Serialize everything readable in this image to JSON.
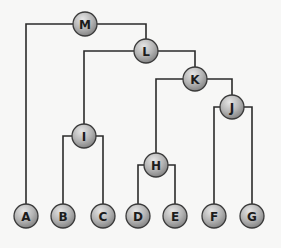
{
  "diagram": {
    "type": "binary-tree",
    "colors": {
      "edge": "#2b2b2b",
      "node_fill_light": "#d9d9d9",
      "node_fill_dark": "#8c8c8c",
      "node_stroke": "#3a3a3a",
      "background": "#f7f7f6"
    },
    "node_radius": 12,
    "nodes": [
      {
        "id": "M",
        "label": "M",
        "x": 85,
        "y": 24
      },
      {
        "id": "L",
        "label": "L",
        "x": 146,
        "y": 51
      },
      {
        "id": "K",
        "label": "K",
        "x": 195,
        "y": 79
      },
      {
        "id": "J",
        "label": "J",
        "x": 232,
        "y": 107
      },
      {
        "id": "I",
        "label": "I",
        "x": 84,
        "y": 136
      },
      {
        "id": "H",
        "label": "H",
        "x": 156,
        "y": 165
      },
      {
        "id": "A",
        "label": "A",
        "x": 26,
        "y": 216
      },
      {
        "id": "B",
        "label": "B",
        "x": 63,
        "y": 216
      },
      {
        "id": "C",
        "label": "C",
        "x": 103,
        "y": 216
      },
      {
        "id": "D",
        "label": "D",
        "x": 138,
        "y": 216
      },
      {
        "id": "E",
        "label": "E",
        "x": 175,
        "y": 216
      },
      {
        "id": "F",
        "label": "F",
        "x": 214,
        "y": 216
      },
      {
        "id": "G",
        "label": "G",
        "x": 252,
        "y": 216
      }
    ],
    "edges": [
      {
        "parent": "M",
        "children": [
          "A",
          "L"
        ]
      },
      {
        "parent": "L",
        "children": [
          "I",
          "K"
        ]
      },
      {
        "parent": "K",
        "children": [
          "H",
          "J"
        ]
      },
      {
        "parent": "J",
        "children": [
          "F",
          "G"
        ]
      },
      {
        "parent": "I",
        "children": [
          "B",
          "C"
        ]
      },
      {
        "parent": "H",
        "children": [
          "D",
          "E"
        ]
      }
    ]
  }
}
